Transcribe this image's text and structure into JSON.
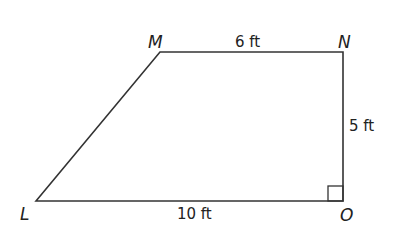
{
  "diagram": {
    "type": "right trapezoid",
    "stroke_color": "#333333",
    "vertices": {
      "M": {
        "label": "M",
        "x": 160,
        "y": 52
      },
      "N": {
        "label": "N",
        "x": 343,
        "y": 52
      },
      "O": {
        "label": "O",
        "x": 343,
        "y": 201
      },
      "L": {
        "label": "L",
        "x": 36,
        "y": 201
      }
    },
    "sides": {
      "MN": {
        "label": "6 ft"
      },
      "NO": {
        "label": "5 ft"
      },
      "LO": {
        "label": "10 ft"
      }
    },
    "right_angle_at": "O"
  }
}
